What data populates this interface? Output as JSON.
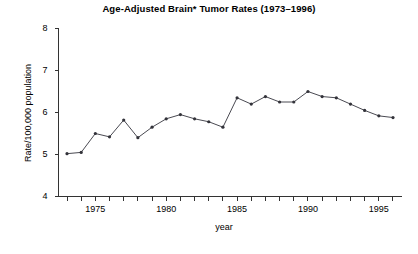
{
  "chart_data": {
    "type": "line",
    "title": "Age-Adjusted Brain* Tumor Rates (1973–1996)",
    "xlabel": "year",
    "ylabel": "Rate/100,000 population",
    "xlim": [
      1972.4,
      1996.6
    ],
    "ylim": [
      4,
      8
    ],
    "yticks": [
      4,
      5,
      6,
      7,
      8
    ],
    "ytick_labels": [
      "4",
      "5",
      "6",
      "7",
      "8"
    ],
    "xticks": [
      1973,
      1974,
      1975,
      1976,
      1977,
      1978,
      1979,
      1980,
      1981,
      1982,
      1983,
      1984,
      1985,
      1986,
      1987,
      1988,
      1989,
      1990,
      1991,
      1992,
      1993,
      1994,
      1995,
      1996
    ],
    "xtick_labels_shown": [
      "1975",
      "1980",
      "1985",
      "1990",
      "1995"
    ],
    "xtick_labels_shown_values": [
      1975,
      1980,
      1985,
      1990,
      1995
    ],
    "grid": false,
    "legend": null,
    "marker": "filled-circle",
    "line_color": "#4a4a52",
    "marker_color": "#33333a",
    "x": [
      1973,
      1974,
      1975,
      1976,
      1977,
      1978,
      1979,
      1980,
      1981,
      1982,
      1983,
      1984,
      1985,
      1986,
      1987,
      1988,
      1989,
      1990,
      1991,
      1992,
      1993,
      1994,
      1995,
      1996
    ],
    "values": [
      5.02,
      5.05,
      5.5,
      5.42,
      5.82,
      5.4,
      5.65,
      5.85,
      5.95,
      5.85,
      5.78,
      5.65,
      6.35,
      6.2,
      6.38,
      6.25,
      6.25,
      6.5,
      6.38,
      6.35,
      6.2,
      6.05,
      5.92,
      5.88
    ],
    "series": [
      {
        "name": "Brain tumor incidence rate",
        "values": [
          5.02,
          5.05,
          5.5,
          5.42,
          5.82,
          5.4,
          5.65,
          5.85,
          5.95,
          5.85,
          5.78,
          5.65,
          6.35,
          6.2,
          6.38,
          6.25,
          6.25,
          6.5,
          6.38,
          6.35,
          6.2,
          6.05,
          5.92,
          5.88
        ]
      }
    ]
  },
  "figure": {
    "title": "Age-Adjusted Brain* Tumor Rates (1973–1996)",
    "xlabel": "year",
    "ylabel": "Rate/100,000 population"
  }
}
